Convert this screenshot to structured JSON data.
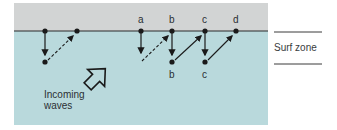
{
  "diagram": {
    "colors": {
      "beach": "#d2d4d4",
      "water": "#b9d9dc",
      "ink": "#1a1a1a"
    },
    "shore_labels": [
      "a",
      "b",
      "c",
      "d"
    ],
    "offshore_labels": [
      "b",
      "c"
    ],
    "waves_label_line1": "Incoming",
    "waves_label_line2": "waves",
    "zone_label": "Surf zone"
  }
}
